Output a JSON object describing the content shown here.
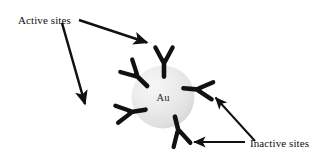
{
  "figure": {
    "type": "schematic-diagram",
    "background_color": "#ffffff",
    "width": 325,
    "height": 163
  },
  "nanoparticle": {
    "label": "Au",
    "shape": "sphere",
    "center": {
      "x": 163,
      "y": 97
    },
    "radius": 31,
    "fill_light": "#f2f2f2",
    "fill_mid": "#e3e3e3",
    "fill_edge": "#cfcfcf",
    "label_color": "#2b2b2b"
  },
  "annotations": [
    {
      "id": "active-sites",
      "text": "Active sites",
      "x": 18,
      "y": 24,
      "color": "#111111"
    },
    {
      "id": "inactive-sites",
      "text": "Inactive sites",
      "x": 250,
      "y": 147,
      "color": "#111111"
    }
  ],
  "arrows": [
    {
      "id": "active-arrow-to-top-antibody",
      "from": {
        "x": 79,
        "y": 20
      },
      "to": {
        "x": 149,
        "y": 43
      },
      "points_to": "antibody-top",
      "color": "#111111",
      "stroke_width": 2.4
    },
    {
      "id": "active-arrow-to-left-antibody",
      "from": {
        "x": 62,
        "y": 23
      },
      "to": {
        "x": 86,
        "y": 106
      },
      "points_to": "antibody-left",
      "color": "#111111",
      "stroke_width": 2.4
    },
    {
      "id": "inactive-arrow-to-right-antibody",
      "from": {
        "x": 254,
        "y": 141
      },
      "to": {
        "x": 214,
        "y": 96
      },
      "points_to": "antibody-right",
      "color": "#111111",
      "stroke_width": 2.0
    },
    {
      "id": "inactive-arrow-to-bottom-antibody",
      "from": {
        "x": 244,
        "y": 142
      },
      "to": {
        "x": 192,
        "y": 142
      },
      "points_to": "antibody-bottom",
      "color": "#111111",
      "stroke_width": 2.0
    }
  ],
  "antibodies": [
    {
      "id": "antibody-top",
      "orientation": "up",
      "rotation_deg": 0,
      "anchor": {
        "x": 164,
        "y": 68
      },
      "classification": "active",
      "color": "#111111"
    },
    {
      "id": "antibody-upper-left",
      "orientation": "upper-left",
      "rotation_deg": -48,
      "anchor": {
        "x": 140,
        "y": 80
      },
      "classification": "active",
      "color": "#111111"
    },
    {
      "id": "antibody-left",
      "orientation": "left",
      "rotation_deg": -98,
      "anchor": {
        "x": 136,
        "y": 110
      },
      "classification": "active",
      "color": "#111111"
    },
    {
      "id": "antibody-right",
      "orientation": "right",
      "rotation_deg": 96,
      "anchor": {
        "x": 191,
        "y": 88
      },
      "classification": "inactive",
      "color": "#111111"
    },
    {
      "id": "antibody-bottom",
      "orientation": "down",
      "rotation_deg": 166,
      "anchor": {
        "x": 176,
        "y": 124
      },
      "classification": "inactive",
      "color": "#111111"
    }
  ]
}
